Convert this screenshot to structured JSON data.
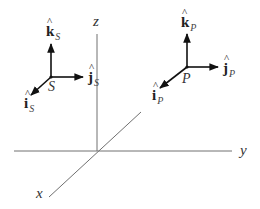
{
  "diagram": {
    "type": "3D coordinate frames",
    "axes": {
      "x": {
        "label": "x"
      },
      "y": {
        "label": "y"
      },
      "z": {
        "label": "z"
      }
    },
    "frames": [
      {
        "origin_label": "S",
        "vectors": [
          {
            "name": "k",
            "hat": "^",
            "subscript": "S",
            "direction": "up"
          },
          {
            "name": "j",
            "hat": "^",
            "subscript": "S",
            "direction": "right"
          },
          {
            "name": "i",
            "hat": "^",
            "subscript": "S",
            "direction": "down-left"
          }
        ]
      },
      {
        "origin_label": "P",
        "vectors": [
          {
            "name": "k",
            "hat": "^",
            "subscript": "P",
            "direction": "up"
          },
          {
            "name": "j",
            "hat": "^",
            "subscript": "P",
            "direction": "right"
          },
          {
            "name": "i",
            "hat": "^",
            "subscript": "P",
            "direction": "down-left"
          }
        ]
      }
    ],
    "colors": {
      "axis": "#707070",
      "vector": "#111111",
      "background": "#ffffff"
    }
  }
}
